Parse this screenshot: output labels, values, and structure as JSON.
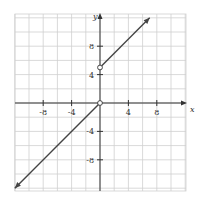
{
  "chart_data": {
    "type": "line",
    "title": "",
    "xlabel": "x",
    "ylabel": "y",
    "xlim": [
      -12,
      12
    ],
    "ylim": [
      -12,
      13
    ],
    "grid": true,
    "grid_step": 2,
    "x_ticks": [
      -8,
      -4,
      4,
      8
    ],
    "y_ticks": [
      8,
      4,
      -4,
      -8
    ],
    "x_tick_labels": [
      "-8",
      "-4",
      "4",
      "8"
    ],
    "y_tick_labels": [
      "8",
      "4",
      "-4",
      "-8"
    ],
    "series": [
      {
        "name": "y = x (x < 0)",
        "x": [
          -12,
          0
        ],
        "y": [
          -12,
          0
        ],
        "start_arrow": true,
        "end_marker": "open-circle"
      },
      {
        "name": "y = x + 5 (x > 0)",
        "x": [
          0,
          7
        ],
        "y": [
          5,
          12
        ],
        "start_marker": "open-circle",
        "end_arrow": true
      }
    ],
    "open_points": [
      [
        0,
        0
      ],
      [
        0,
        5
      ]
    ],
    "colors": {
      "grid": "#c8c8c8",
      "axis": "#333333",
      "line": "#444444"
    }
  }
}
